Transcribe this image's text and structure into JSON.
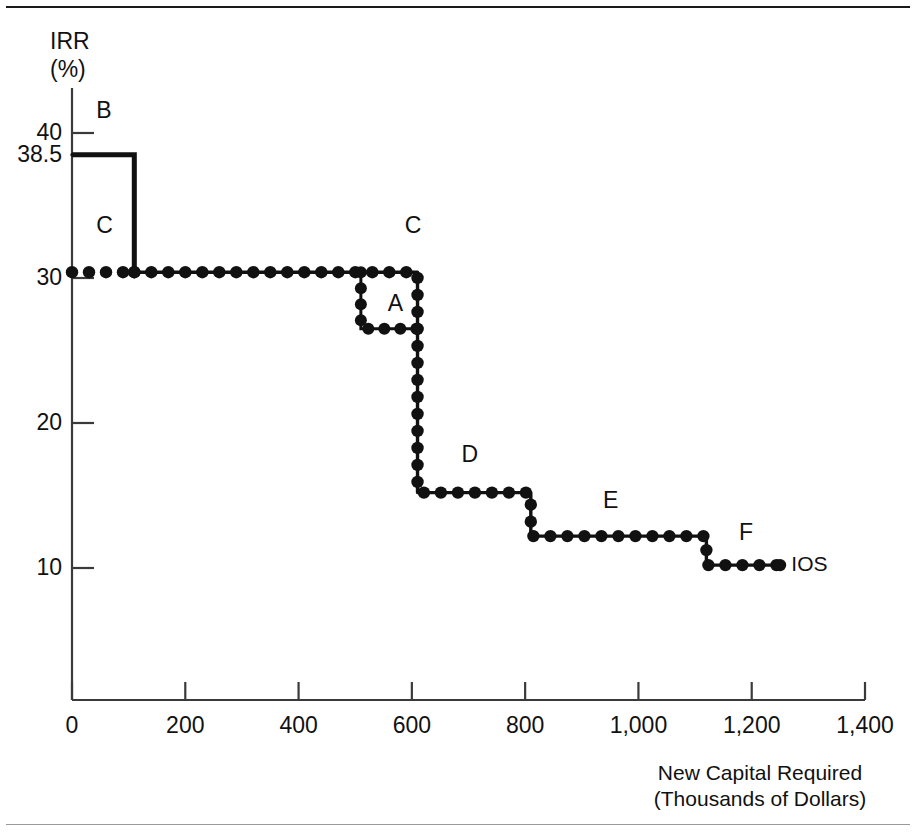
{
  "figure": {
    "y_axis_title_line1": "IRR",
    "y_axis_title_line2": "(%)",
    "x_axis_caption_line1": "New Capital Required",
    "x_axis_caption_line2": "(Thousands of Dollars)",
    "curve_label": "IOS",
    "line_color": "#111111",
    "axis_color": "#3a3a3a",
    "background": "#ffffff"
  },
  "chart_data": {
    "type": "line",
    "title": "",
    "subtitle": "",
    "xlabel": "New Capital Required (Thousands of Dollars)",
    "ylabel": "IRR (%)",
    "xlim": [
      0,
      1400
    ],
    "ylim": [
      0,
      44
    ],
    "grid": false,
    "legend": "none",
    "x_ticks": [
      0,
      200,
      400,
      600,
      800,
      1000,
      1200,
      1400
    ],
    "x_tick_labels": [
      "0",
      "200",
      "400",
      "600",
      "800",
      "1,000",
      "1,200",
      "1,400"
    ],
    "y_ticks": [
      10,
      20,
      30,
      38.5,
      40
    ],
    "y_tick_labels": [
      "10",
      "20",
      "30",
      "38.5",
      "40"
    ],
    "curve_name": "IOS",
    "steps": [
      {
        "project": "B",
        "irr": 38.5,
        "x_start": 0,
        "x_end": 110,
        "style": "solid",
        "label": "B",
        "label_x": 55,
        "label_y": 41.5
      },
      {
        "project": "C",
        "irr": 30.4,
        "x_start": 0,
        "x_end": 610,
        "style": "dotted",
        "label": "C",
        "label_x": 55,
        "label_y": 33.6
      },
      {
        "project": "C",
        "irr": 30.4,
        "x_start": 0,
        "x_end": 610,
        "style": "dotted",
        "label": "C",
        "label_x": 600,
        "label_y": 33.6
      },
      {
        "project": "A",
        "irr": 26.5,
        "x_start": 510,
        "x_end": 610,
        "style": "dotted",
        "label": "A",
        "label_x": 570,
        "label_y": 28.2
      },
      {
        "project": "D",
        "irr": 15.2,
        "x_start": 610,
        "x_end": 810,
        "style": "dotted",
        "label": "D",
        "label_x": 700,
        "label_y": 17.8
      },
      {
        "project": "E",
        "irr": 12.2,
        "x_start": 810,
        "x_end": 1120,
        "style": "dotted",
        "label": "E",
        "label_x": 950,
        "label_y": 14.6
      },
      {
        "project": "F",
        "irr": 10.2,
        "x_start": 1120,
        "x_end": 1250,
        "style": "dotted",
        "label": "F",
        "label_x": 1190,
        "label_y": 12.4
      }
    ],
    "series": [
      {
        "name": "IOS",
        "x": [
          0,
          110,
          110,
          610,
          610,
          810,
          810,
          1120,
          1120,
          1250
        ],
        "values": [
          38.5,
          38.5,
          30.4,
          30.4,
          15.2,
          15.2,
          12.2,
          12.2,
          10.2,
          10.2
        ]
      },
      {
        "name": "A-branch",
        "x": [
          510,
          510,
          610
        ],
        "values": [
          30.4,
          26.5,
          26.5
        ]
      }
    ],
    "annotations": [
      {
        "text": "B",
        "x": 55,
        "y": 41.5
      },
      {
        "text": "C",
        "x": 55,
        "y": 33.6
      },
      {
        "text": "C",
        "x": 600,
        "y": 33.6
      },
      {
        "text": "A",
        "x": 570,
        "y": 28.2
      },
      {
        "text": "D",
        "x": 700,
        "y": 17.8
      },
      {
        "text": "E",
        "x": 950,
        "y": 14.6
      },
      {
        "text": "F",
        "x": 1190,
        "y": 12.4
      },
      {
        "text": "IOS",
        "x": 1270,
        "y": 10.2
      }
    ]
  }
}
